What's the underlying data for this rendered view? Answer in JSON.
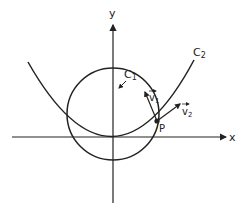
{
  "diagram": {
    "axes": {
      "x_label": "x",
      "y_label": "y"
    },
    "curves": [
      {
        "id": "C1",
        "label": "C",
        "subscript": "1",
        "shape": "circle"
      },
      {
        "id": "C2",
        "label": "C",
        "subscript": "2",
        "shape": "parabola"
      }
    ],
    "point": {
      "label": "P"
    },
    "vectors": [
      {
        "id": "v1",
        "label": "v",
        "subscript": "1",
        "tangent_to": "C1"
      },
      {
        "id": "v2",
        "label": "v",
        "subscript": "2",
        "tangent_to": "C2"
      }
    ],
    "colors": {
      "stroke": "#222222",
      "background": "#ffffff"
    }
  }
}
